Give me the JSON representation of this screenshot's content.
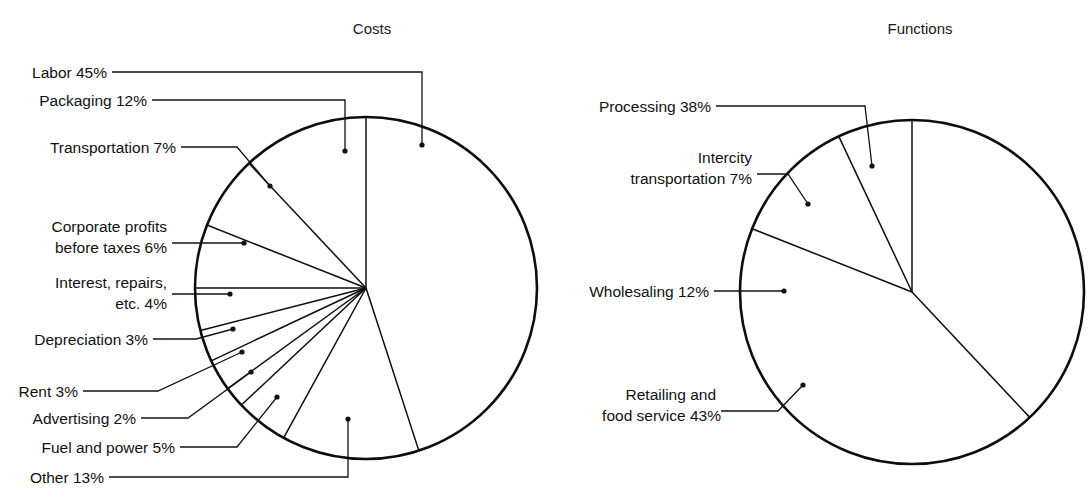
{
  "figure": {
    "background": "#ffffff",
    "ink_color": "#111111",
    "width": 1092,
    "height": 497
  },
  "charts": [
    {
      "id": "costs",
      "title": "Costs",
      "title_pos": {
        "x": 372,
        "y": 34
      },
      "center": {
        "x": 366,
        "y": 288
      },
      "radius": 171,
      "start_angle_deg": -90,
      "direction": "clockwise",
      "labels": [
        {
          "key": "labor",
          "lines": [
            "Labor 45%"
          ],
          "text_pos": {
            "x": 107,
            "y": 78
          },
          "leader": "M112,72 L422,72 L422,145",
          "dot": {
            "x": 422,
            "y": 145
          }
        },
        {
          "key": "packaging",
          "lines": [
            "Packaging 12%"
          ],
          "text_pos": {
            "x": 147,
            "y": 106
          },
          "leader": "M152,100 L345,100 L345,151",
          "dot": {
            "x": 345,
            "y": 151
          }
        },
        {
          "key": "transportation",
          "lines": [
            "Transportation 7%"
          ],
          "text_pos": {
            "x": 176,
            "y": 153
          },
          "leader": "M181,147 L237,147 L270,186",
          "dot": {
            "x": 270,
            "y": 186
          }
        },
        {
          "key": "corporate-profits",
          "lines": [
            "Corporate profits",
            "before taxes 6%"
          ],
          "text_pos": {
            "x": 167,
            "y": 232
          },
          "leader": "M172,243 L244,243",
          "dot": {
            "x": 244,
            "y": 243
          }
        },
        {
          "key": "interest-repairs",
          "lines": [
            "Interest, repairs,",
            "etc. 4%"
          ],
          "text_pos": {
            "x": 167,
            "y": 288
          },
          "leader": "M172,294 L230,294",
          "dot": {
            "x": 230,
            "y": 294
          }
        },
        {
          "key": "depreciation",
          "lines": [
            "Depreciation 3%"
          ],
          "text_pos": {
            "x": 148,
            "y": 345
          },
          "leader": "M153,339 L196,339 L233,329",
          "dot": {
            "x": 233,
            "y": 329
          }
        },
        {
          "key": "rent",
          "lines": [
            "Rent 3%"
          ],
          "text_pos": {
            "x": 78,
            "y": 397
          },
          "leader": "M83,391 L158,391 L242,352",
          "dot": {
            "x": 242,
            "y": 352
          }
        },
        {
          "key": "advertising",
          "lines": [
            "Advertising 2%"
          ],
          "text_pos": {
            "x": 136,
            "y": 424
          },
          "leader": "M141,418 L188,418 L251,372",
          "dot": {
            "x": 251,
            "y": 372
          }
        },
        {
          "key": "fuel-and-power",
          "lines": [
            "Fuel and power 5%"
          ],
          "text_pos": {
            "x": 175,
            "y": 453
          },
          "leader": "M180,447 L237,447 L277,397",
          "dot": {
            "x": 277,
            "y": 397
          }
        },
        {
          "key": "other",
          "lines": [
            "Other 13%"
          ],
          "text_pos": {
            "x": 104,
            "y": 483
          },
          "leader": "M109,477 L348,477 L348,419",
          "dot": {
            "x": 348,
            "y": 419
          }
        }
      ]
    },
    {
      "id": "functions",
      "title": "Functions",
      "title_pos": {
        "x": 920,
        "y": 34
      },
      "center": {
        "x": 912,
        "y": 292
      },
      "radius": 172,
      "start_angle_deg": -90,
      "direction": "clockwise",
      "labels": [
        {
          "key": "processing",
          "lines": [
            "Processing 38%"
          ],
          "text_pos": {
            "x": 711,
            "y": 112
          },
          "leader": "M716,106 L865,106 L872,166",
          "dot": {
            "x": 872,
            "y": 166
          }
        },
        {
          "key": "intercity-transportation",
          "lines": [
            "Intercity",
            "transportation 7%"
          ],
          "text_pos": {
            "x": 752,
            "y": 163
          },
          "leader": "M757,174 L788,174 L808,204",
          "dot": {
            "x": 808,
            "y": 204
          }
        },
        {
          "key": "wholesaling",
          "lines": [
            "Wholesaling 12%"
          ],
          "text_pos": {
            "x": 709,
            "y": 297
          },
          "leader": "M714,291 L784,291",
          "dot": {
            "x": 784,
            "y": 291
          }
        },
        {
          "key": "retailing",
          "lines": [
            "Retailing and",
            "food service 43%"
          ],
          "text_pos": {
            "x": 716,
            "y": 400
          },
          "leader": "M721,411 L778,411 L803,385",
          "dot": {
            "x": 803,
            "y": 385
          }
        }
      ]
    }
  ],
  "chart_data": [
    {
      "type": "pie",
      "title": "Costs",
      "xlabel": "",
      "ylabel": "",
      "unit": "percent",
      "categories": [
        "Labor",
        "Other",
        "Fuel and power",
        "Advertising",
        "Rent",
        "Depreciation",
        "Interest, repairs, etc.",
        "Corporate profits before taxes",
        "Transportation",
        "Packaging"
      ],
      "values": [
        45,
        13,
        5,
        2,
        3,
        3,
        4,
        6,
        7,
        12
      ],
      "labels": [
        "Labor 45%",
        "Other 13%",
        "Fuel and power 5%",
        "Advertising 2%",
        "Rent 3%",
        "Depreciation 3%",
        "Interest, repairs, etc. 4%",
        "Corporate profits before taxes 6%",
        "Transportation 7%",
        "Packaging 12%"
      ],
      "total": 100,
      "start_angle_deg": -90,
      "direction": "clockwise",
      "legend": "none",
      "grid": false
    },
    {
      "type": "pie",
      "title": "Functions",
      "xlabel": "",
      "ylabel": "",
      "unit": "percent",
      "categories": [
        "Processing",
        "Retailing and food service",
        "Wholesaling",
        "Intercity transportation"
      ],
      "values": [
        38,
        43,
        12,
        7
      ],
      "labels": [
        "Processing 38%",
        "Retailing and food service 43%",
        "Wholesaling 12%",
        "Intercity transportation 7%"
      ],
      "total": 100,
      "start_angle_deg": -90,
      "direction": "clockwise",
      "legend": "none",
      "grid": false
    }
  ]
}
